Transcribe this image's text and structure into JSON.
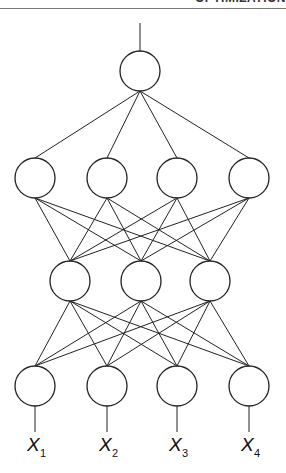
{
  "header": {
    "running_title": "OPTIMIZATION"
  },
  "diagram": {
    "type": "feedforward-neural-network",
    "layers": [
      {
        "name": "output",
        "nodes": 1
      },
      {
        "name": "hidden-2",
        "nodes": 4
      },
      {
        "name": "hidden-1",
        "nodes": 3
      },
      {
        "name": "input",
        "nodes": 4
      }
    ],
    "connectivity": "fully-connected",
    "output_lines": 1,
    "input_labels": [
      {
        "base": "X",
        "sub": "1"
      },
      {
        "base": "X",
        "sub": "2"
      },
      {
        "base": "X",
        "sub": "3"
      },
      {
        "base": "X",
        "sub": "4"
      }
    ]
  }
}
